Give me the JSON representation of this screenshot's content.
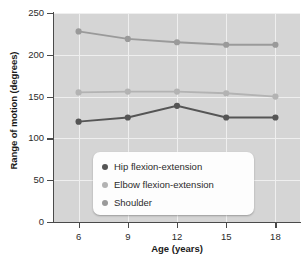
{
  "chart_data": {
    "type": "line",
    "title": "",
    "xlabel": "Age (years)",
    "ylabel": "Range of motion (degrees)",
    "x": [
      6,
      9,
      12,
      15,
      18
    ],
    "xticklabels": [
      "6",
      "9",
      "12",
      "15",
      "18"
    ],
    "yticklabels": [
      "0",
      "50",
      "100",
      "150",
      "200",
      "250"
    ],
    "yticks": [
      0,
      50,
      100,
      150,
      200,
      250
    ],
    "xlim": [
      4.5,
      19.5
    ],
    "ylim": [
      0,
      250
    ],
    "grid": true,
    "legend_position": "lower center",
    "series": [
      {
        "name": "Hip flexion-extension",
        "values": [
          120,
          125,
          139,
          125,
          125
        ],
        "color": "#555555"
      },
      {
        "name": "Elbow flexion-extension",
        "values": [
          155,
          156,
          156,
          154,
          150
        ],
        "color": "#b3b3b3"
      },
      {
        "name": "Shoulder",
        "values": [
          228,
          219,
          215,
          212,
          212
        ],
        "color": "#9a9a9a"
      }
    ]
  },
  "axes": {
    "xlabel": "Age (years)",
    "ylabel": "Range of motion (degrees)"
  },
  "legend": {
    "items": [
      {
        "label": "Hip flexion-extension",
        "color": "#555555"
      },
      {
        "label": "Elbow flexion-extension",
        "color": "#b3b3b3"
      },
      {
        "label": "Shoulder",
        "color": "#9a9a9a"
      }
    ]
  },
  "colors": {
    "plot_background": "#d5d5d5",
    "gridline": "#efefef",
    "axis": "#4a4a4a",
    "page_background": "#ffffff"
  }
}
